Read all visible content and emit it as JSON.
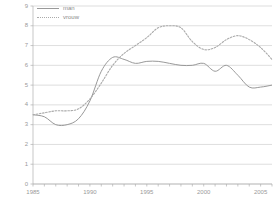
{
  "chart_data": {
    "type": "line",
    "title": "",
    "subtitle": "",
    "xlabel": "",
    "ylabel": "",
    "xlim": [
      1985,
      2006
    ],
    "ylim": [
      0,
      9
    ],
    "grid": true,
    "grid_axis": "y",
    "legend_position": "top-left",
    "y_ticks": [
      0,
      1,
      2,
      3,
      4,
      5,
      6,
      7,
      8,
      9
    ],
    "y_tick_labels": [
      "0",
      "1",
      "2",
      "3",
      "4",
      "5",
      "6",
      "7",
      "8",
      "9"
    ],
    "x_ticks": [
      1985,
      1990,
      1995,
      2000,
      2005
    ],
    "x_tick_labels": [
      "1985",
      "1990",
      "1995",
      "2000",
      "2005"
    ],
    "x_minor_ticks": [
      1985,
      1986,
      1987,
      1988,
      1989,
      1990,
      1991,
      1992,
      1993,
      1994,
      1995,
      1996,
      1997,
      1998,
      1999,
      2000,
      2001,
      2002,
      2003,
      2004,
      2005,
      2006
    ],
    "x": [
      1985,
      1986,
      1987,
      1988,
      1989,
      1990,
      1991,
      1992,
      1993,
      1994,
      1995,
      1996,
      1997,
      1998,
      1999,
      2000,
      2001,
      2002,
      2003,
      2004,
      2005,
      2006
    ],
    "series": [
      {
        "name": "man",
        "style": "solid",
        "color": "#999999",
        "values": [
          3.5,
          3.4,
          3.0,
          3.0,
          3.3,
          4.2,
          5.7,
          6.4,
          6.3,
          6.1,
          6.2,
          6.2,
          6.1,
          6.0,
          6.0,
          6.1,
          5.7,
          6.0,
          5.5,
          4.9,
          4.9,
          5.0
        ]
      },
      {
        "name": "vrouw",
        "style": "dotted",
        "color": "#aaaaaa",
        "values": [
          3.5,
          3.6,
          3.7,
          3.7,
          3.8,
          4.3,
          5.1,
          6.0,
          6.6,
          7.0,
          7.4,
          7.9,
          8.0,
          7.9,
          7.2,
          6.8,
          6.9,
          7.3,
          7.5,
          7.3,
          6.9,
          6.3
        ]
      }
    ],
    "legend": [
      {
        "label": "man",
        "style": "solid",
        "color": "#999999"
      },
      {
        "label": "vrouw",
        "style": "dotted",
        "color": "#aaaaaa"
      }
    ]
  },
  "axes": {
    "y_labels": [
      "9",
      "8",
      "7",
      "6",
      "5",
      "4",
      "3",
      "2",
      "1",
      "0"
    ],
    "x_labels": [
      "1985",
      "1990",
      "1995",
      "2000",
      "2005"
    ]
  },
  "legend": {
    "man_label": "man",
    "vrouw_label": "vrouw"
  },
  "colors": {
    "grid": "#c8c8c8",
    "axis": "#b0b0b0",
    "man": "#999999",
    "vrouw": "#aaaaaa",
    "text": "#9a9a9a",
    "background": "#ffffff"
  }
}
